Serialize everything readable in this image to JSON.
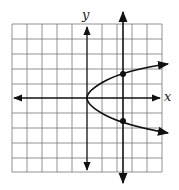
{
  "figure": {
    "x_label": "x",
    "y_label": "y",
    "grid": {
      "cols": 10,
      "rows": 10
    },
    "curve": "parabola opening right, vertex at origin",
    "vertical_line": "vertical line intersecting parabola at two points",
    "intersection_points": 2,
    "colors": {
      "grid": "#777777",
      "axis": "#111111",
      "curve": "#111111"
    }
  }
}
